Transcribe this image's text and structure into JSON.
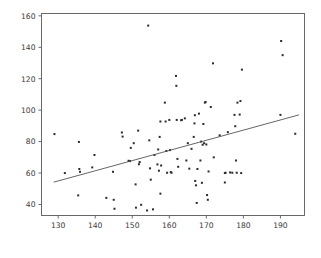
{
  "chart_data": {
    "type": "scatter",
    "title": "",
    "xlabel": "",
    "ylabel": "",
    "xlim": [
      125.5,
      196.5
    ],
    "ylim": [
      33.0,
      161.5
    ],
    "xticks": [
      130,
      140,
      150,
      160,
      170,
      180,
      190
    ],
    "yticks": [
      40,
      60,
      80,
      100,
      120,
      140,
      160
    ],
    "grid": false,
    "legend": null,
    "marker": "square-dot",
    "marker_color": "#2b2b2b",
    "marker_size_px": 2.0,
    "series": [
      {
        "name": "observations",
        "points": [
          [
            129.0,
            84.8
          ],
          [
            131.8,
            60.0
          ],
          [
            135.6,
            79.8
          ],
          [
            135.7,
            62.6
          ],
          [
            135.9,
            60.8
          ],
          [
            135.4,
            45.8
          ],
          [
            139.2,
            63.6
          ],
          [
            139.8,
            71.5
          ],
          [
            143.0,
            44.2
          ],
          [
            144.8,
            60.8
          ],
          [
            145.0,
            43.0
          ],
          [
            145.2,
            37.3
          ],
          [
            147.2,
            85.8
          ],
          [
            147.4,
            83.2
          ],
          [
            149.0,
            67.8
          ],
          [
            149.4,
            67.6
          ],
          [
            149.6,
            76.0
          ],
          [
            150.4,
            79.0
          ],
          [
            150.9,
            52.8
          ],
          [
            151.0,
            38.0
          ],
          [
            151.6,
            87.0
          ],
          [
            151.8,
            65.6
          ],
          [
            152.0,
            67.0
          ],
          [
            152.4,
            39.8
          ],
          [
            154.3,
            153.8
          ],
          [
            154.0,
            36.2
          ],
          [
            154.6,
            80.8
          ],
          [
            154.8,
            63.0
          ],
          [
            155.0,
            55.8
          ],
          [
            155.6,
            36.9
          ],
          [
            156.0,
            71.5
          ],
          [
            156.8,
            65.5
          ],
          [
            157.0,
            75.0
          ],
          [
            157.2,
            61.5
          ],
          [
            157.4,
            83.0
          ],
          [
            157.6,
            92.8
          ],
          [
            157.8,
            64.8
          ],
          [
            157.6,
            46.9
          ],
          [
            158.8,
            104.8
          ],
          [
            159.0,
            92.8
          ],
          [
            159.2,
            74.0
          ],
          [
            159.4,
            60.2
          ],
          [
            160.0,
            93.8
          ],
          [
            160.2,
            74.6
          ],
          [
            160.4,
            60.6
          ],
          [
            160.6,
            60.2
          ],
          [
            161.8,
            121.8
          ],
          [
            161.9,
            115.5
          ],
          [
            162.0,
            93.8
          ],
          [
            162.2,
            69.0
          ],
          [
            162.4,
            64.0
          ],
          [
            163.2,
            93.6
          ],
          [
            163.4,
            93.8
          ],
          [
            164.2,
            94.8
          ],
          [
            164.6,
            68.0
          ],
          [
            165.0,
            79.0
          ],
          [
            165.4,
            62.8
          ],
          [
            166.0,
            75.4
          ],
          [
            166.6,
            83.0
          ],
          [
            166.8,
            91.6
          ],
          [
            166.9,
            96.8
          ],
          [
            167.0,
            55.0
          ],
          [
            167.2,
            52.2
          ],
          [
            167.4,
            41.0
          ],
          [
            167.6,
            62.6
          ],
          [
            168.0,
            97.8
          ],
          [
            168.4,
            68.0
          ],
          [
            168.6,
            80.0
          ],
          [
            168.8,
            53.8
          ],
          [
            169.0,
            78.0
          ],
          [
            169.2,
            91.2
          ],
          [
            169.4,
            79.0
          ],
          [
            169.6,
            104.8
          ],
          [
            169.8,
            105.2
          ],
          [
            170.0,
            78.2
          ],
          [
            170.2,
            46.0
          ],
          [
            170.4,
            43.0
          ],
          [
            170.6,
            61.0
          ],
          [
            171.2,
            102.0
          ],
          [
            171.8,
            129.8
          ],
          [
            172.0,
            70.0
          ],
          [
            173.6,
            84.0
          ],
          [
            175.0,
            60.0
          ],
          [
            175.2,
            60.2
          ],
          [
            175.0,
            54.0
          ],
          [
            175.8,
            86.0
          ],
          [
            176.4,
            60.4
          ],
          [
            177.0,
            60.2
          ],
          [
            177.6,
            97.0
          ],
          [
            177.8,
            89.8
          ],
          [
            178.0,
            68.0
          ],
          [
            178.2,
            60.2
          ],
          [
            178.4,
            104.8
          ],
          [
            179.0,
            97.2
          ],
          [
            179.2,
            105.8
          ],
          [
            179.4,
            60.0
          ],
          [
            179.6,
            125.8
          ],
          [
            190.2,
            144.0
          ],
          [
            190.6,
            135.0
          ],
          [
            190.0,
            97.0
          ],
          [
            194.0,
            85.0
          ]
        ]
      }
    ],
    "trend_line": {
      "name": "linear-fit",
      "color": "#555555",
      "x0": 128.8,
      "y0": 54.2,
      "x1": 195.0,
      "y1": 97.0
    }
  }
}
